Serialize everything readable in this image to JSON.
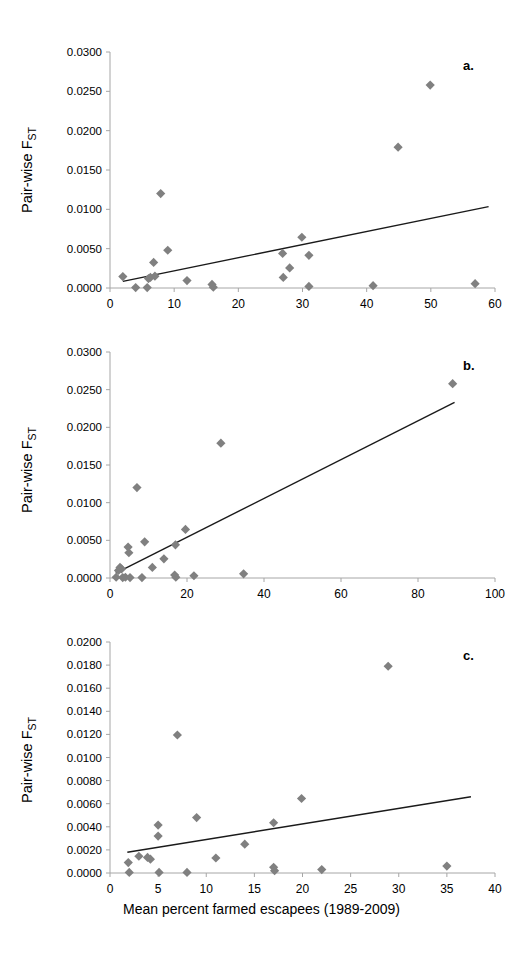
{
  "figure": {
    "x_axis_title": "Mean percent farmed escapees (1989-2009)",
    "y_axis_title_main": "Pair-wise F",
    "y_axis_title_sub": "ST",
    "marker_color": "#808080",
    "line_color": "#1a1a1a",
    "axis_color": "#a6a6a6",
    "text_color": "#000000",
    "background": "#ffffff"
  },
  "panels": [
    {
      "id": "a",
      "letter": "a."
    },
    {
      "id": "b",
      "letter": "b."
    },
    {
      "id": "c",
      "letter": "c."
    }
  ],
  "chart_data": [
    {
      "type": "scatter",
      "panel": "a",
      "title": "a.",
      "xlabel": "Mean percent farmed escapees (1989-2009)",
      "ylabel": "Pair-wise FST",
      "xlim": [
        0,
        60
      ],
      "ylim": [
        0,
        0.03
      ],
      "xticks": [
        0,
        10,
        20,
        30,
        40,
        50,
        60
      ],
      "yticks": [
        0.0,
        0.005,
        0.01,
        0.015,
        0.02,
        0.025,
        0.03
      ],
      "ytick_labels": [
        "0.0000",
        "0.0050",
        "0.0100",
        "0.0150",
        "0.0200",
        "0.0250",
        "0.0300"
      ],
      "xtick_labels": [
        "0",
        "10",
        "20",
        "30",
        "40",
        "50",
        "60"
      ],
      "grid": false,
      "legend": "none",
      "points": [
        {
          "x": 2.0,
          "y": 0.00145
        },
        {
          "x": 4.0,
          "y": 5e-05
        },
        {
          "x": 5.8,
          "y": 5e-05
        },
        {
          "x": 6.0,
          "y": 0.0012
        },
        {
          "x": 6.3,
          "y": 0.00135
        },
        {
          "x": 6.8,
          "y": 0.00325
        },
        {
          "x": 7.0,
          "y": 0.0015
        },
        {
          "x": 7.9,
          "y": 0.012
        },
        {
          "x": 9.0,
          "y": 0.0048
        },
        {
          "x": 12.0,
          "y": 0.00095
        },
        {
          "x": 15.9,
          "y": 0.00045
        },
        {
          "x": 16.1,
          "y": 0.0001
        },
        {
          "x": 26.9,
          "y": 0.0044
        },
        {
          "x": 27.0,
          "y": 0.00135
        },
        {
          "x": 28.0,
          "y": 0.00255
        },
        {
          "x": 29.9,
          "y": 0.00645
        },
        {
          "x": 31.0,
          "y": 0.00415
        },
        {
          "x": 31.0,
          "y": 0.0002
        },
        {
          "x": 41.0,
          "y": 0.0003
        },
        {
          "x": 44.9,
          "y": 0.0179
        },
        {
          "x": 49.9,
          "y": 0.0258
        },
        {
          "x": 56.9,
          "y": 0.00055
        }
      ],
      "trendline": {
        "x0": 2.0,
        "y0": 0.00085,
        "x1": 59.0,
        "y1": 0.01035
      }
    },
    {
      "type": "scatter",
      "panel": "b",
      "title": "b.",
      "xlabel": "Mean percent farmed escapees (1989-2009)",
      "ylabel": "Pair-wise FST",
      "xlim": [
        0,
        100
      ],
      "ylim": [
        0,
        0.03
      ],
      "xticks": [
        0,
        20,
        40,
        60,
        80,
        100
      ],
      "yticks": [
        0.0,
        0.005,
        0.01,
        0.015,
        0.02,
        0.025,
        0.03
      ],
      "ytick_labels": [
        "0.0000",
        "0.0050",
        "0.0100",
        "0.0150",
        "0.0200",
        "0.0250",
        "0.0300"
      ],
      "xtick_labels": [
        "0",
        "20",
        "40",
        "60",
        "80",
        "100"
      ],
      "grid": false,
      "legend": "none",
      "points": [
        {
          "x": 1.6,
          "y": 0.0001
        },
        {
          "x": 2.2,
          "y": 0.001
        },
        {
          "x": 2.6,
          "y": 0.0014
        },
        {
          "x": 3.0,
          "y": 0.0012
        },
        {
          "x": 3.3,
          "y": 5e-05
        },
        {
          "x": 4.0,
          "y": 0.0001
        },
        {
          "x": 4.7,
          "y": 0.0041
        },
        {
          "x": 4.9,
          "y": 0.00335
        },
        {
          "x": 5.2,
          "y": 5e-05
        },
        {
          "x": 7.0,
          "y": 0.012
        },
        {
          "x": 8.3,
          "y": 5e-05
        },
        {
          "x": 9.0,
          "y": 0.0048
        },
        {
          "x": 11.0,
          "y": 0.0014
        },
        {
          "x": 14.0,
          "y": 0.00255
        },
        {
          "x": 16.8,
          "y": 0.0004
        },
        {
          "x": 17.0,
          "y": 0.0044
        },
        {
          "x": 17.1,
          "y": 0.0001
        },
        {
          "x": 19.6,
          "y": 0.00645
        },
        {
          "x": 21.8,
          "y": 0.0003
        },
        {
          "x": 28.8,
          "y": 0.0179
        },
        {
          "x": 34.7,
          "y": 0.00055
        },
        {
          "x": 89.0,
          "y": 0.0258
        }
      ],
      "trendline": {
        "x0": 1.5,
        "y0": 0.00065,
        "x1": 89.5,
        "y1": 0.0233
      }
    },
    {
      "type": "scatter",
      "panel": "c",
      "title": "c.",
      "xlabel": "Mean percent farmed escapees (1989-2009)",
      "ylabel": "Pair-wise FST",
      "xlim": [
        0,
        40
      ],
      "ylim": [
        0,
        0.02
      ],
      "xticks": [
        0,
        5,
        10,
        15,
        20,
        25,
        30,
        35,
        40
      ],
      "yticks": [
        0.0,
        0.002,
        0.004,
        0.006,
        0.008,
        0.01,
        0.012,
        0.014,
        0.016,
        0.018,
        0.02
      ],
      "ytick_labels": [
        "0.0000",
        "0.0020",
        "0.0040",
        "0.0060",
        "0.0080",
        "0.0100",
        "0.0120",
        "0.0140",
        "0.0160",
        "0.0180",
        "0.0200"
      ],
      "xtick_labels": [
        "0",
        "5",
        "10",
        "15",
        "20",
        "25",
        "30",
        "35",
        "40"
      ],
      "grid": false,
      "legend": "none",
      "points": [
        {
          "x": 1.9,
          "y": 0.0009
        },
        {
          "x": 2.0,
          "y": 5e-05
        },
        {
          "x": 3.0,
          "y": 0.00145
        },
        {
          "x": 3.9,
          "y": 0.00135
        },
        {
          "x": 4.2,
          "y": 0.0012
        },
        {
          "x": 5.0,
          "y": 0.00415
        },
        {
          "x": 5.0,
          "y": 0.0032
        },
        {
          "x": 5.1,
          "y": 5e-05
        },
        {
          "x": 7.0,
          "y": 0.01195
        },
        {
          "x": 8.0,
          "y": 5e-05
        },
        {
          "x": 9.0,
          "y": 0.0048
        },
        {
          "x": 11.0,
          "y": 0.0013
        },
        {
          "x": 14.0,
          "y": 0.0025
        },
        {
          "x": 17.0,
          "y": 0.00435
        },
        {
          "x": 17.0,
          "y": 0.0005
        },
        {
          "x": 17.1,
          "y": 0.0002
        },
        {
          "x": 19.9,
          "y": 0.00645
        },
        {
          "x": 22.0,
          "y": 0.0003
        },
        {
          "x": 28.9,
          "y": 0.0179
        },
        {
          "x": 35.0,
          "y": 0.0006
        }
      ],
      "trendline": {
        "x0": 1.8,
        "y0": 0.0018,
        "x1": 37.5,
        "y1": 0.0066
      }
    }
  ]
}
